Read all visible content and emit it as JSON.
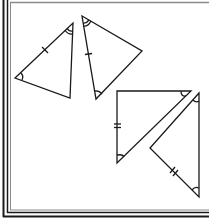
{
  "diagram": {
    "title": "",
    "colors": {
      "stroke": "#1a1a1a",
      "frame": "#1a1a1a",
      "frame_inner": "#8a8a8a",
      "background": "#ffffff"
    },
    "triangles": [
      {
        "id": "triangle-1",
        "vertices": [
          [
            15,
            78
          ],
          [
            73,
            23
          ],
          [
            70,
            98
          ]
        ],
        "tick_marks": [
          {
            "side": "AB",
            "count": 1,
            "at": [
              45,
              50
            ]
          }
        ],
        "angle_marks": [
          {
            "vertex": "B",
            "arcs": 2
          },
          {
            "vertex": "A",
            "arcs": 1
          }
        ]
      },
      {
        "id": "triangle-2",
        "vertices": [
          [
            82,
            16
          ],
          [
            142,
            51
          ],
          [
            96,
            99
          ]
        ],
        "tick_marks": [
          {
            "side": "DF",
            "count": 1,
            "at": [
              88,
              54
            ]
          }
        ],
        "angle_marks": [
          {
            "vertex": "D",
            "arcs": 2
          },
          {
            "vertex": "F",
            "arcs": 1
          }
        ]
      },
      {
        "id": "triangle-3",
        "vertices": [
          [
            117,
            91
          ],
          [
            191,
            91
          ],
          [
            117,
            163
          ]
        ],
        "right_angle_at": "G",
        "tick_marks": [
          {
            "side": "GI",
            "count": 2,
            "at": [
              117,
              126
            ]
          }
        ],
        "angle_marks": [
          {
            "vertex": "H",
            "arcs": 1
          },
          {
            "vertex": "I",
            "arcs": 1
          }
        ]
      },
      {
        "id": "triangle-4",
        "vertices": [
          [
            199,
            93
          ],
          [
            150,
            148
          ],
          [
            199,
            197
          ]
        ],
        "tick_marks": [
          {
            "side": "KL",
            "count": 2,
            "at": [
              174,
              172
            ]
          }
        ],
        "angle_marks": [
          {
            "vertex": "J",
            "arcs": 1
          },
          {
            "vertex": "L",
            "arcs": 1
          }
        ]
      }
    ]
  }
}
